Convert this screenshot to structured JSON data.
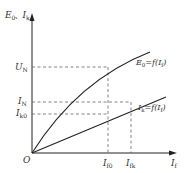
{
  "diagram": {
    "axes": {
      "y_label_main": "E",
      "y_label_sub": "0",
      "y_label_sep": "、",
      "y_label2_main": "I",
      "y_label2_sub": "k",
      "x_label_main": "I",
      "x_label_sub": "f",
      "origin": "O"
    },
    "ticks": {
      "U_N": {
        "main": "U",
        "sub": "N"
      },
      "I_N": {
        "main": "I",
        "sub": "N"
      },
      "I_k0": {
        "main": "I",
        "sub": "k0"
      },
      "I_f0": {
        "main": "I",
        "sub": "f0"
      },
      "I_fk": {
        "main": "I",
        "sub": "fk"
      }
    },
    "curves": {
      "e0": {
        "label": "E",
        "label_sub": "0",
        "label_rest": "=f(I",
        "label_rest_sub": "f",
        "label_close": ")"
      },
      "ik": {
        "label": "I",
        "label_sub": "k",
        "label_rest": "=f(I",
        "label_rest_sub": "f",
        "label_close": ")"
      }
    },
    "colors": {
      "line": "#222222",
      "dashed": "#666666",
      "text": "#333333"
    }
  }
}
